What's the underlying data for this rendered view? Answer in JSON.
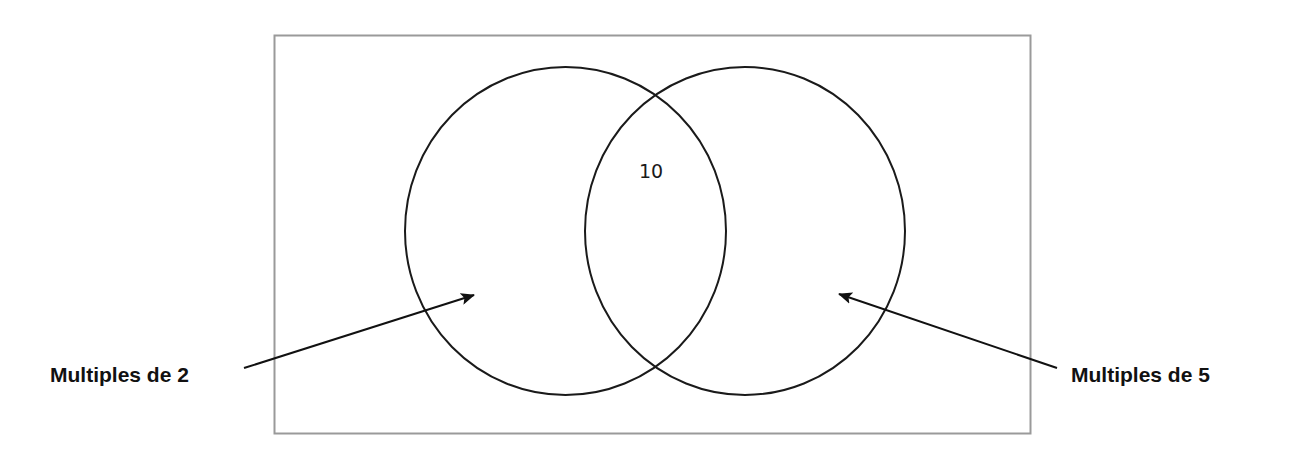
{
  "diagram": {
    "type": "venn",
    "universe_border_color": "#9a9a9a",
    "circle_stroke_color": "#1a1a1a",
    "sets": [
      {
        "id": "left",
        "label": "Multiples de 2"
      },
      {
        "id": "right",
        "label": "Multiples de 5"
      }
    ],
    "regions": {
      "intersection": {
        "value": "10"
      }
    }
  }
}
